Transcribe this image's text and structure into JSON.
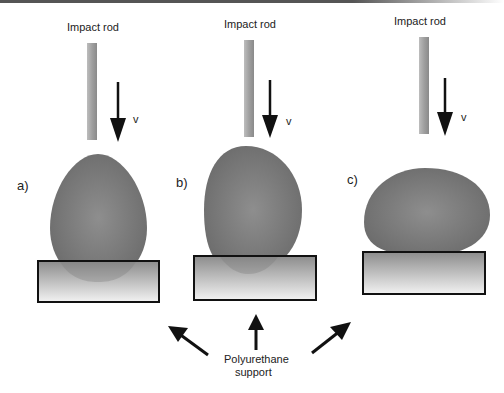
{
  "figure": {
    "panels": [
      {
        "id": "a",
        "label": "a)",
        "rod_label": "Impact rod",
        "velocity_label": "v",
        "egg_orientation": "vertical, pointed end up"
      },
      {
        "id": "b",
        "label": "b)",
        "rod_label": "Impact rod",
        "velocity_label": "v",
        "egg_orientation": "vertical, blunt end up"
      },
      {
        "id": "c",
        "label": "c)",
        "rod_label": "Impact rod",
        "velocity_label": "v",
        "egg_orientation": "horizontal, on side"
      }
    ],
    "support_label_line1": "Polyurethane",
    "support_label_line2": "support",
    "colors": {
      "egg": "#7a7a7a",
      "rod": "#a8a8a8",
      "support_top": "#8a8a8a",
      "support_bottom": "#f0f0f0",
      "arrow": "#111111"
    }
  }
}
